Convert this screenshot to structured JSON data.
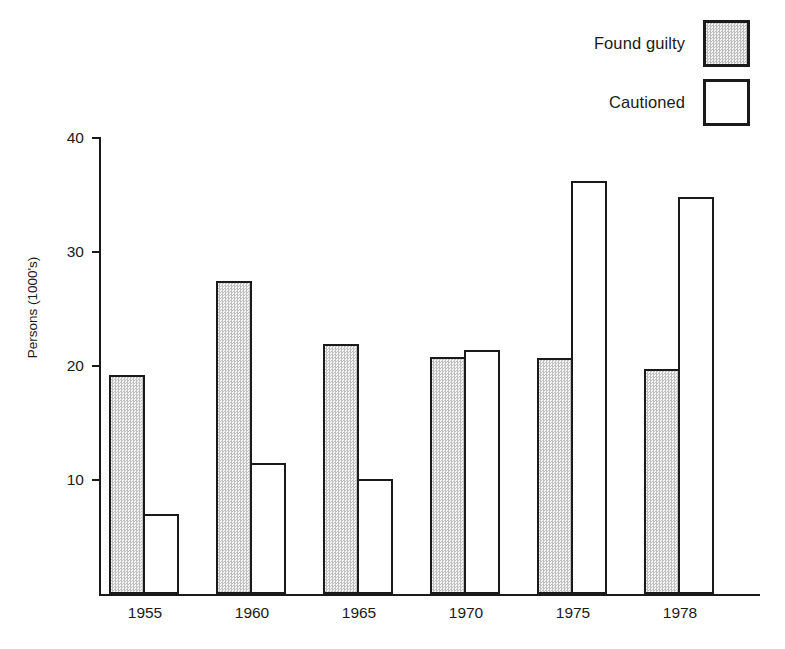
{
  "legend": {
    "entries": [
      {
        "label": "Found guilty",
        "swatch": "filled-square-icon",
        "fill": "hatched"
      },
      {
        "label": "Cautioned",
        "swatch": "empty-square-icon",
        "fill": "white"
      }
    ]
  },
  "axes": {
    "y_title": "Persons (1000's)",
    "y_ticks": [
      "10",
      "20",
      "30",
      "40"
    ],
    "y_tick_values": [
      10,
      20,
      30,
      40
    ],
    "x_ticks": [
      "1955",
      "1960",
      "1965",
      "1970",
      "1975",
      "1978"
    ]
  },
  "colors": {
    "ink": "#1a1a1a",
    "hatch_fill": "#e2e2e2",
    "background": "#ffffff"
  },
  "chart_data": {
    "type": "bar",
    "title": "",
    "xlabel": "",
    "ylabel": "Persons (1000's)",
    "categories": [
      "1955",
      "1960",
      "1965",
      "1970",
      "1975",
      "1978"
    ],
    "series": [
      {
        "name": "Found guilty",
        "values": [
          19.2,
          27.5,
          21.9,
          20.8,
          20.7,
          19.7
        ]
      },
      {
        "name": "Cautioned",
        "values": [
          7.0,
          11.5,
          10.1,
          21.4,
          36.2,
          34.8
        ]
      }
    ],
    "ylim": [
      0,
      40
    ],
    "yticks": [
      10,
      20,
      30,
      40
    ],
    "grid": false,
    "legend_position": "top-right"
  }
}
